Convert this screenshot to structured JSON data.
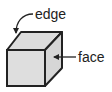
{
  "diagram": {
    "labels": {
      "edge": "edge",
      "face": "face"
    },
    "colors": {
      "face_fill": "#dcdcdc",
      "stroke": "#222222",
      "background": "#ffffff"
    }
  }
}
